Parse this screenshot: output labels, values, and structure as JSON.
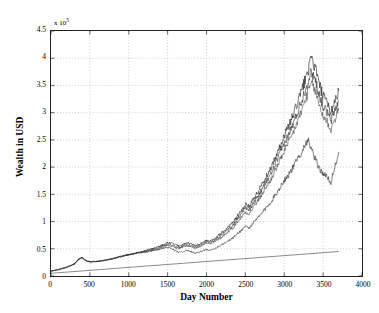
{
  "chart_data": {
    "type": "line",
    "title": "",
    "xlabel": "Day Number",
    "ylabel": "Wealth in USD",
    "y_multiplier_text": "x 10",
    "y_multiplier_exponent": "5",
    "y_scale": 100000,
    "xlim": [
      0,
      4000
    ],
    "ylim": [
      0,
      450000
    ],
    "xticks": [
      0,
      500,
      1000,
      1500,
      2000,
      2500,
      3000,
      3500,
      4000
    ],
    "xticklabels": [
      "0",
      "500",
      "1000",
      "1500",
      "2000",
      "2500",
      "3000",
      "3500",
      "4000"
    ],
    "yticks": [
      0,
      0.5,
      1,
      1.5,
      2,
      2.5,
      3,
      3.5,
      4,
      4.5
    ],
    "yticklabels": [
      "0",
      "0.5",
      "1",
      "1.5",
      "2",
      "2.5",
      "3",
      "3.5",
      "4",
      "4.5"
    ],
    "grid": true,
    "grid_style": "dotted",
    "legend_position": "inline-annotations",
    "annotations": [
      {
        "name": "Tt3",
        "x": 3780,
        "y": 355000
      },
      {
        "name": "Tt2",
        "x": 3780,
        "y": 310000
      },
      {
        "name": "Tt1",
        "x": 3780,
        "y": 272000
      },
      {
        "name": "Buy-and-Hold",
        "x": 2980,
        "y": 158000
      },
      {
        "name": "Bank",
        "x": 3780,
        "y": 43000
      }
    ],
    "series": [
      {
        "name": "Tt3",
        "color": "#1a1a1a",
        "x": [
          0,
          100,
          200,
          300,
          350,
          400,
          450,
          500,
          600,
          700,
          800,
          900,
          1000,
          1100,
          1200,
          1300,
          1400,
          1450,
          1500,
          1550,
          1600,
          1650,
          1700,
          1750,
          1800,
          1850,
          1900,
          1950,
          2000,
          2050,
          2100,
          2150,
          2200,
          2250,
          2300,
          2350,
          2400,
          2450,
          2500,
          2550,
          2600,
          2650,
          2700,
          2750,
          2800,
          2850,
          2900,
          2950,
          3000,
          3050,
          3100,
          3150,
          3200,
          3250,
          3300,
          3350,
          3400,
          3450,
          3500,
          3550,
          3600,
          3650,
          3700
        ],
        "y": [
          9000,
          12000,
          16000,
          22000,
          30000,
          34000,
          28000,
          26000,
          27000,
          29000,
          32000,
          36000,
          39000,
          42000,
          46000,
          50000,
          55000,
          58000,
          62000,
          60000,
          57000,
          55000,
          58000,
          61000,
          59000,
          56000,
          58000,
          62000,
          66000,
          64000,
          68000,
          74000,
          80000,
          86000,
          92000,
          100000,
          112000,
          120000,
          132000,
          128000,
          140000,
          152000,
          165000,
          178000,
          190000,
          205000,
          222000,
          240000,
          258000,
          272000,
          290000,
          310000,
          330000,
          352000,
          375000,
          398000,
          382000,
          352000,
          330000,
          318000,
          300000,
          322000,
          340000
        ]
      },
      {
        "name": "Tt2",
        "color": "#333333",
        "x": [
          0,
          100,
          200,
          300,
          350,
          400,
          450,
          500,
          600,
          700,
          800,
          900,
          1000,
          1100,
          1200,
          1300,
          1400,
          1450,
          1500,
          1550,
          1600,
          1650,
          1700,
          1750,
          1800,
          1850,
          1900,
          1950,
          2000,
          2050,
          2100,
          2150,
          2200,
          2250,
          2300,
          2350,
          2400,
          2450,
          2500,
          2550,
          2600,
          2650,
          2700,
          2750,
          2800,
          2850,
          2900,
          2950,
          3000,
          3050,
          3100,
          3150,
          3200,
          3250,
          3300,
          3350,
          3400,
          3450,
          3500,
          3550,
          3600,
          3650,
          3700
        ],
        "y": [
          9000,
          12000,
          16000,
          22000,
          30000,
          34000,
          28000,
          26000,
          27000,
          29000,
          32000,
          36000,
          39000,
          42000,
          45000,
          49000,
          53000,
          56000,
          59000,
          57000,
          54000,
          52000,
          55000,
          58000,
          56000,
          53000,
          55000,
          59000,
          63000,
          61000,
          65000,
          70000,
          76000,
          82000,
          88000,
          95000,
          106000,
          114000,
          125000,
          121000,
          133000,
          144000,
          156000,
          168000,
          180000,
          194000,
          210000,
          227000,
          244000,
          257000,
          274000,
          293000,
          312000,
          333000,
          355000,
          376000,
          361000,
          333000,
          312000,
          301000,
          284000,
          305000,
          322000
        ]
      },
      {
        "name": "Tt1",
        "color": "#4a4a4a",
        "x": [
          0,
          100,
          200,
          300,
          350,
          400,
          450,
          500,
          600,
          700,
          800,
          900,
          1000,
          1100,
          1200,
          1300,
          1400,
          1450,
          1500,
          1550,
          1600,
          1650,
          1700,
          1750,
          1800,
          1850,
          1900,
          1950,
          2000,
          2050,
          2100,
          2150,
          2200,
          2250,
          2300,
          2350,
          2400,
          2450,
          2500,
          2550,
          2600,
          2650,
          2700,
          2750,
          2800,
          2850,
          2900,
          2950,
          3000,
          3050,
          3100,
          3150,
          3200,
          3250,
          3300,
          3350,
          3400,
          3450,
          3500,
          3550,
          3600,
          3650,
          3700
        ],
        "y": [
          9000,
          12000,
          16000,
          22000,
          30000,
          34000,
          28000,
          26000,
          27000,
          29000,
          32000,
          36000,
          39000,
          42000,
          44000,
          47000,
          51000,
          54000,
          57000,
          55000,
          52000,
          50000,
          53000,
          56000,
          54000,
          51000,
          53000,
          57000,
          60000,
          58000,
          62000,
          67000,
          72000,
          78000,
          84000,
          90000,
          100000,
          108000,
          118000,
          114000,
          126000,
          136000,
          147000,
          159000,
          170000,
          183000,
          198000,
          214000,
          230000,
          242000,
          258000,
          276000,
          294000,
          314000,
          335000,
          354000,
          340000,
          314000,
          294000,
          284000,
          268000,
          288000,
          304000
        ]
      },
      {
        "name": "Buy-and-Hold",
        "color": "#2b2b2b",
        "x": [
          0,
          100,
          200,
          300,
          350,
          400,
          450,
          500,
          600,
          700,
          800,
          900,
          1000,
          1100,
          1200,
          1300,
          1400,
          1450,
          1500,
          1550,
          1600,
          1650,
          1700,
          1750,
          1800,
          1850,
          1900,
          1950,
          2000,
          2050,
          2100,
          2150,
          2200,
          2250,
          2300,
          2350,
          2400,
          2450,
          2500,
          2550,
          2600,
          2650,
          2700,
          2750,
          2800,
          2850,
          2900,
          2950,
          3000,
          3050,
          3100,
          3150,
          3200,
          3250,
          3300,
          3350,
          3400,
          3450,
          3500,
          3550,
          3600,
          3650,
          3700
        ],
        "y": [
          9000,
          12000,
          16000,
          22000,
          30000,
          34000,
          28000,
          26000,
          27000,
          29000,
          32000,
          36000,
          39000,
          42000,
          44000,
          46000,
          49000,
          51000,
          53000,
          50000,
          46000,
          43000,
          45000,
          47000,
          45000,
          42000,
          43000,
          46000,
          49000,
          47000,
          50000,
          54000,
          58000,
          62000,
          66000,
          71000,
          78000,
          84000,
          92000,
          88000,
          97000,
          105000,
          113000,
          122000,
          131000,
          141000,
          152000,
          164000,
          176000,
          185000,
          196000,
          209000,
          222000,
          236000,
          251000,
          232000,
          214000,
          198000,
          188000,
          182000,
          172000,
          200000,
          228000
        ]
      },
      {
        "name": "Bank",
        "color": "#555555",
        "straight": true,
        "x": [
          0,
          3700
        ],
        "y": [
          5000,
          45000
        ]
      }
    ]
  }
}
